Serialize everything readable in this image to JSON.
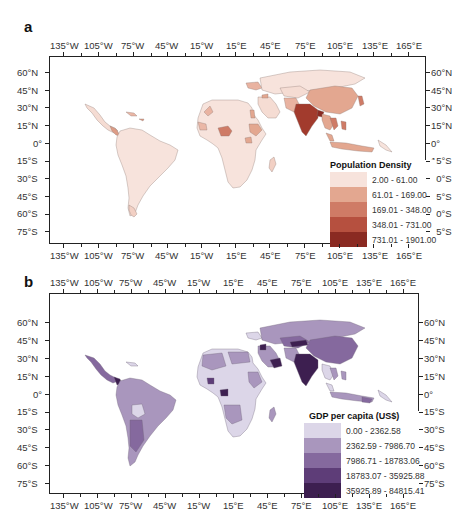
{
  "figure": {
    "panels": [
      {
        "id": "a",
        "letter": "a",
        "legend": {
          "title": "Population Density",
          "items": [
            {
              "label": "2.00 - 61.00",
              "color": "#f7e3dc"
            },
            {
              "label": "61.01 - 169.00",
              "color": "#e3a790"
            },
            {
              "label": "169.01 - 348.00",
              "color": "#cf7b66"
            },
            {
              "label": "348.01 - 731.00",
              "color": "#b6503f"
            },
            {
              "label": "731.01 - 1901.00",
              "color": "#8a2a22"
            }
          ]
        }
      },
      {
        "id": "b",
        "letter": "b",
        "legend": {
          "title": "GDP per capita (US$)",
          "items": [
            {
              "label": "0.00 - 2362.58",
              "color": "#dcd6e8"
            },
            {
              "label": "2362.59 - 7986.70",
              "color": "#a996bd"
            },
            {
              "label": "7986.71 - 18783.06",
              "color": "#85699e"
            },
            {
              "label": "18783.07 - 35925.88",
              "color": "#5e3d78"
            },
            {
              "label": "35925.89 - 84815.41",
              "color": "#3d1f50"
            }
          ]
        }
      }
    ],
    "x_ticks": [
      "135°W",
      "105°W",
      "75°W",
      "45°W",
      "15°W",
      "15°E",
      "45°E",
      "75°E",
      "105°E",
      "135°E",
      "165°E"
    ],
    "y_ticks": [
      "60°N",
      "45°N",
      "30°N",
      "15°N",
      "0°",
      "15°S",
      "30°S",
      "45°S",
      "60°S",
      "75°S"
    ]
  },
  "chart_data": [
    {
      "type": "heatmap",
      "title": "a",
      "subtitle": "Choropleth world map (Americas, Africa, Asia, Oceania)",
      "legend_title": "Population Density",
      "legend_position": "lower right, inside frame",
      "classes": [
        "2.00 - 61.00",
        "61.01 - 169.00",
        "169.01 - 348.00",
        "348.01 - 731.00",
        "731.01 - 1901.00"
      ],
      "xlabel": "",
      "ylabel": "",
      "x_tick_labels": [
        "135°W",
        "105°W",
        "75°W",
        "45°W",
        "15°W",
        "15°E",
        "45°E",
        "75°E",
        "105°E",
        "135°E",
        "165°E"
      ],
      "y_tick_labels": [
        "60°N",
        "45°N",
        "30°N",
        "15°N",
        "0°",
        "15°S",
        "30°S",
        "45°S",
        "60°S",
        "75°S"
      ],
      "xlim": [
        -150,
        180
      ],
      "ylim": [
        -82,
        70
      ],
      "grid": false,
      "notable_regions": [
        {
          "region": "India",
          "class": "731.01 - 1901.00"
        },
        {
          "region": "Bangladesh",
          "class": "731.01 - 1901.00"
        },
        {
          "region": "Nigeria",
          "class": "169.01 - 348.00"
        },
        {
          "region": "China",
          "class": "61.01 - 169.00"
        },
        {
          "region": "Southeast Asia (Vietnam, Philippines)",
          "class": "169.01 - 348.00"
        },
        {
          "region": "Ethiopia / Uganda",
          "class": "61.01 - 169.00"
        },
        {
          "region": "Pakistan",
          "class": "169.01 - 348.00"
        },
        {
          "region": "Central America",
          "class": "61.01 - 169.00"
        },
        {
          "region": "South America (most)",
          "class": "2.00 - 61.00"
        },
        {
          "region": "Africa (most)",
          "class": "2.00 - 61.00"
        },
        {
          "region": "Russia / Central Asia",
          "class": "2.00 - 61.00"
        }
      ]
    },
    {
      "type": "heatmap",
      "title": "b",
      "subtitle": "Choropleth world map (Americas, Africa, Asia, Oceania)",
      "legend_title": "GDP per capita (US$)",
      "legend_position": "lower right, inside frame",
      "classes": [
        "0.00 - 2362.58",
        "2362.59 - 7986.70",
        "7986.71 - 18783.06",
        "18783.07 - 35925.88",
        "35925.89 - 84815.41"
      ],
      "xlabel": "",
      "ylabel": "",
      "x_tick_labels": [
        "135°W",
        "105°W",
        "75°W",
        "45°W",
        "15°W",
        "15°E",
        "45°E",
        "75°E",
        "105°E",
        "135°E",
        "165°E"
      ],
      "y_tick_labels": [
        "60°N",
        "45°N",
        "30°N",
        "15°N",
        "0°",
        "15°S",
        "30°S",
        "45°S",
        "60°S",
        "75°S"
      ],
      "xlim": [
        -150,
        180
      ],
      "ylim": [
        -82,
        70
      ],
      "grid": false,
      "notable_regions": [
        {
          "region": "India",
          "class": "35925.89 - 84815.41"
        },
        {
          "region": "Mexico",
          "class": "7986.71 - 18783.06"
        },
        {
          "region": "Central America (Panama)",
          "class": "35925.89 - 84815.41"
        },
        {
          "region": "China",
          "class": "7986.71 - 18783.06"
        },
        {
          "region": "Saudi Arabia / Gulf",
          "class": "18783.07 - 35925.88"
        },
        {
          "region": "Brazil / South America (most)",
          "class": "2362.59 - 7986.70"
        },
        {
          "region": "Bolivia / Paraguay",
          "class": "0.00 - 2362.58"
        },
        {
          "region": "Sub-Saharan Africa (most)",
          "class": "0.00 - 2362.58"
        },
        {
          "region": "North Africa",
          "class": "2362.59 - 7986.70"
        },
        {
          "region": "Gabon / Equatorial Guinea",
          "class": "35925.89 - 84815.41"
        },
        {
          "region": "Russia / Central Asia",
          "class": "2362.59 - 7986.70"
        }
      ]
    }
  ]
}
